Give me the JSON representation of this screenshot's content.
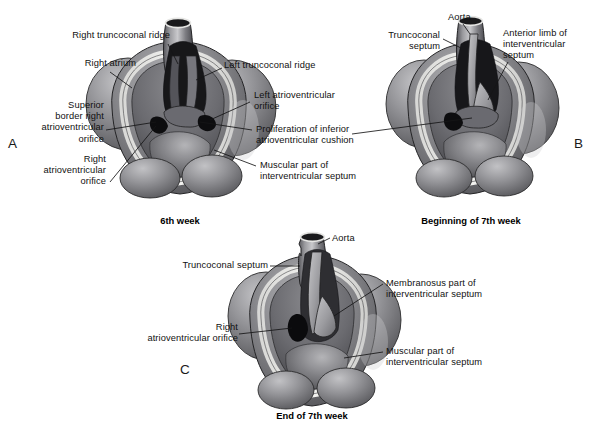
{
  "figure": {
    "type": "medical-illustration",
    "panel_count": 3,
    "background_color": "#ffffff",
    "ink_color": "#111111"
  },
  "panels": [
    {
      "letter": "A",
      "caption": "6th week",
      "labels": [
        {
          "id": "a-right-truncoconal-ridge",
          "text": "Right truncoconal ridge"
        },
        {
          "id": "a-right-atrium",
          "text": "Right atrium"
        },
        {
          "id": "a-superior-border",
          "text": "Superior\nborder right\natrioventricular\norifice"
        },
        {
          "id": "a-right-av-orifice",
          "text": "Right\natrioventricular\norifice"
        },
        {
          "id": "a-left-truncoconal-ridge",
          "text": "Left truncoconal ridge"
        },
        {
          "id": "a-left-av-orifice",
          "text": "Left atrioventricular\norifice"
        },
        {
          "id": "a-proliferation",
          "text": "Proliferation of inferior\natrioventricular cushion"
        },
        {
          "id": "a-muscular-ivs",
          "text": "Muscular part of\ninterventricular septum"
        }
      ]
    },
    {
      "letter": "B",
      "caption": "Beginning of 7th week",
      "labels": [
        {
          "id": "b-aorta",
          "text": "Aorta"
        },
        {
          "id": "b-truncoconal-septum",
          "text": "Truncoconal\nseptum"
        },
        {
          "id": "b-anterior-limb",
          "text": "Anterior limb of\ninterventricular\nseptum"
        }
      ]
    },
    {
      "letter": "C",
      "caption": "End of 7th week",
      "labels": [
        {
          "id": "c-aorta",
          "text": "Aorta"
        },
        {
          "id": "c-truncoconal-septum",
          "text": "Truncoconal septum"
        },
        {
          "id": "c-right-av-orifice",
          "text": "Right\natrioventricular orifice"
        },
        {
          "id": "c-membranosus",
          "text": "Membranosus part of\ninterventricular septum"
        },
        {
          "id": "c-muscular-ivs",
          "text": "Muscular part of\ninterventricular septum"
        }
      ]
    }
  ],
  "palette": {
    "outflow_dark": "#2e2e30",
    "cavity_black": "#131315",
    "wall_mid": "#7d7d80",
    "wall_light": "#b4b4b7",
    "highlight": "#e9e9e9",
    "rim_white": "#f2f2f0",
    "shadow": "#4a4a4d",
    "outline": "#1c1c1e"
  }
}
